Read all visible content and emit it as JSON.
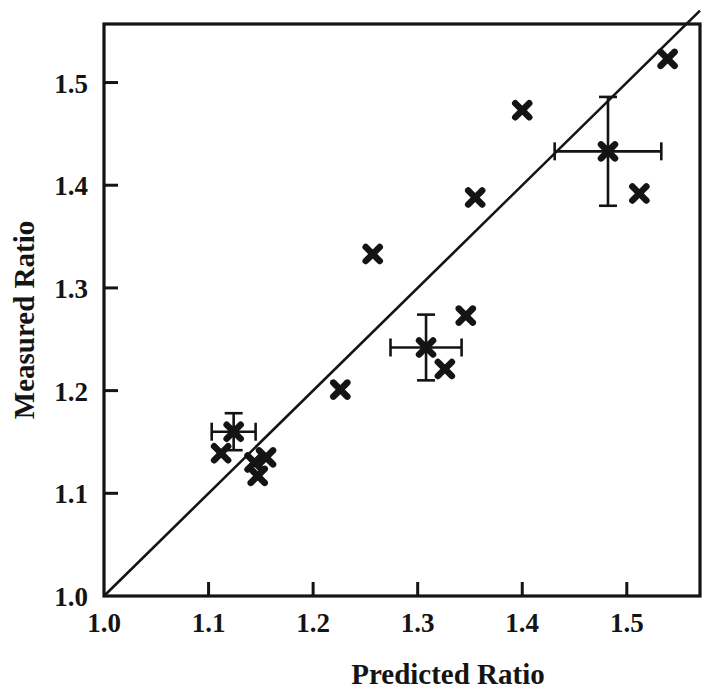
{
  "chart_data": {
    "type": "scatter",
    "title": "",
    "xlabel": "Predicted Ratio",
    "ylabel": "Measured Ratio",
    "xlim": [
      1.0,
      1.57
    ],
    "ylim": [
      1.0,
      1.557
    ],
    "xticks": [
      "1.0",
      "1.1",
      "1.2",
      "1.3",
      "1.4",
      "1.5"
    ],
    "yticks": [
      "1.0",
      "1.1",
      "1.2",
      "1.3",
      "1.4",
      "1.5"
    ],
    "xtick_values": [
      1.0,
      1.1,
      1.2,
      1.3,
      1.4,
      1.5
    ],
    "ytick_values": [
      1.0,
      1.1,
      1.2,
      1.3,
      1.4,
      1.5
    ],
    "grid": false,
    "legend": "none",
    "reference_line": {
      "name": "identity-line",
      "x": [
        1.0,
        1.57
      ],
      "y": [
        1.0,
        1.57
      ],
      "style": "solid",
      "color": "#141414"
    },
    "series": [
      {
        "name": "data-points",
        "marker": "x",
        "color": "#141414",
        "points": [
          {
            "x": 1.112,
            "y": 1.139
          },
          {
            "x": 1.144,
            "y": 1.13
          },
          {
            "x": 1.155,
            "y": 1.135
          },
          {
            "x": 1.147,
            "y": 1.117
          },
          {
            "x": 1.226,
            "y": 1.201
          },
          {
            "x": 1.257,
            "y": 1.333
          },
          {
            "x": 1.326,
            "y": 1.221
          },
          {
            "x": 1.346,
            "y": 1.273
          },
          {
            "x": 1.355,
            "y": 1.388
          },
          {
            "x": 1.4,
            "y": 1.473
          },
          {
            "x": 1.512,
            "y": 1.392
          },
          {
            "x": 1.539,
            "y": 1.523
          }
        ]
      },
      {
        "name": "mean-points-with-error-bars",
        "marker": "x-with-errorbars",
        "color": "#141414",
        "points": [
          {
            "x": 1.124,
            "y": 1.16,
            "xerr": 0.021,
            "yerr": 0.018
          },
          {
            "x": 1.308,
            "y": 1.242,
            "xerr": 0.034,
            "yerr": 0.032
          },
          {
            "x": 1.482,
            "y": 1.433,
            "xerr": 0.051,
            "yerr": 0.053
          }
        ]
      }
    ]
  },
  "axes": {
    "x_title": "Predicted Ratio",
    "y_title": "Measured Ratio"
  }
}
